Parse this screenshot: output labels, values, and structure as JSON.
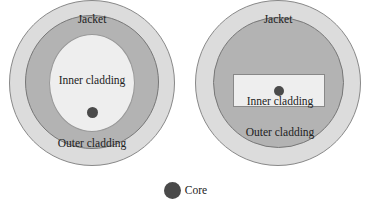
{
  "colors": {
    "jacket": "#dcdcdc",
    "outer_cladding": "#b3b3b3",
    "inner_cladding": "#eeeeee",
    "core": "#4a4a4a",
    "outline": "#777777"
  },
  "figures": [
    {
      "id": "concentric-fiber",
      "labels": {
        "jacket": "Jacket",
        "inner": "Inner cladding",
        "outer": "Outer cladding"
      }
    },
    {
      "id": "rectangular-inner-fiber",
      "labels": {
        "jacket": "Jacket",
        "inner": "Inner cladding",
        "outer": "Outer cladding"
      }
    }
  ],
  "legend": {
    "core_label": "Core"
  }
}
